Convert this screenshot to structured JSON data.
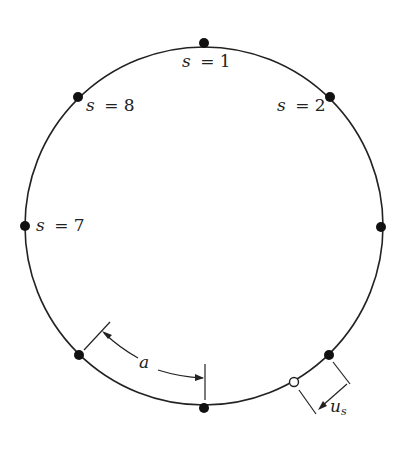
{
  "diagram": {
    "type": "circle-with-nodes",
    "center": [
      204,
      226
    ],
    "radius": 179,
    "stroke_color": "#222222",
    "nodes": [
      {
        "id": "s1",
        "angle_deg": 90,
        "label": "s = 1",
        "label_var": "s",
        "label_eq": "= 1"
      },
      {
        "id": "s2",
        "angle_deg": 45,
        "label": "s = 2",
        "label_var": "s",
        "label_eq": "= 2"
      },
      {
        "id": "s3",
        "angle_deg": 0,
        "label": ""
      },
      {
        "id": "s4",
        "angle_deg": -45,
        "label": ""
      },
      {
        "id": "s5",
        "angle_deg": -90,
        "label": ""
      },
      {
        "id": "s6",
        "angle_deg": -135,
        "label": ""
      },
      {
        "id": "s7",
        "angle_deg": 180,
        "label": "s = 7",
        "label_var": "s",
        "label_eq": "= 7"
      },
      {
        "id": "s8",
        "angle_deg": 135,
        "label": "s = 8",
        "label_var": "s",
        "label_eq": "= 8"
      }
    ],
    "displaced_node": {
      "label": "open circle (displaced position)"
    },
    "annotations": {
      "spacing_label": "a",
      "displacement_label": "u",
      "displacement_subscript": "s"
    }
  }
}
